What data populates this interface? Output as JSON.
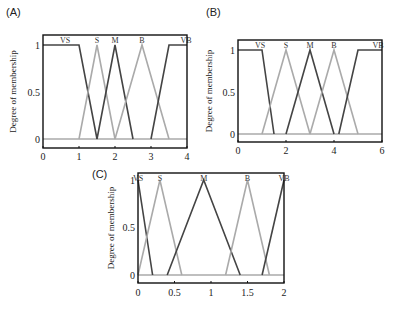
{
  "chart_data": [
    {
      "panel": "(A)",
      "type": "line",
      "ylabel": "Degree of membership",
      "xlabel": "",
      "xlim": [
        0,
        4
      ],
      "ylim": [
        0,
        1
      ],
      "xticks": [
        "0",
        "1",
        "2",
        "3",
        "4"
      ],
      "yticks": [
        "0",
        "0.5",
        "1"
      ],
      "series": [
        {
          "name": "VS",
          "color": "#444444",
          "points": [
            [
              0,
              1
            ],
            [
              1,
              1
            ],
            [
              1.5,
              0
            ]
          ]
        },
        {
          "name": "S",
          "color": "#aaaaaa",
          "points": [
            [
              1,
              0
            ],
            [
              1.5,
              1
            ],
            [
              2,
              0
            ]
          ]
        },
        {
          "name": "M",
          "color": "#444444",
          "points": [
            [
              1.5,
              0
            ],
            [
              2,
              1
            ],
            [
              2.5,
              0
            ]
          ]
        },
        {
          "name": "B",
          "color": "#aaaaaa",
          "points": [
            [
              2,
              0
            ],
            [
              2.75,
              1
            ],
            [
              3.5,
              0
            ]
          ]
        },
        {
          "name": "VB",
          "color": "#444444",
          "points": [
            [
              3,
              0
            ],
            [
              3.5,
              1
            ],
            [
              4,
              1
            ]
          ]
        }
      ]
    },
    {
      "panel": "(B)",
      "type": "line",
      "ylabel": "Degree of membership",
      "xlabel": "",
      "xlim": [
        0,
        6
      ],
      "ylim": [
        0,
        1
      ],
      "xticks": [
        "0",
        "2",
        "4",
        "6"
      ],
      "yticks": [
        "0",
        "0.5",
        "1"
      ],
      "series": [
        {
          "name": "VS",
          "color": "#444444",
          "points": [
            [
              0,
              1
            ],
            [
              1,
              1
            ],
            [
              1.5,
              0
            ]
          ]
        },
        {
          "name": "S",
          "color": "#aaaaaa",
          "points": [
            [
              1,
              0
            ],
            [
              2,
              1
            ],
            [
              3,
              0
            ]
          ]
        },
        {
          "name": "M",
          "color": "#444444",
          "points": [
            [
              2,
              0
            ],
            [
              3,
              1
            ],
            [
              4,
              0
            ]
          ]
        },
        {
          "name": "B",
          "color": "#aaaaaa",
          "points": [
            [
              3,
              0
            ],
            [
              4,
              1
            ],
            [
              5,
              0
            ]
          ]
        },
        {
          "name": "VB",
          "color": "#444444",
          "points": [
            [
              4.2,
              0
            ],
            [
              5,
              1
            ],
            [
              6,
              1
            ]
          ]
        }
      ]
    },
    {
      "panel": "(C)",
      "type": "line",
      "ylabel": "Degree of membership",
      "xlabel": "",
      "xlim": [
        0,
        2
      ],
      "ylim": [
        0,
        1
      ],
      "xticks": [
        "0",
        "0.5",
        "1",
        "1.5",
        "2"
      ],
      "yticks": [
        "0",
        "0.5",
        "1"
      ],
      "series": [
        {
          "name": "VS",
          "color": "#444444",
          "points": [
            [
              0,
              1
            ],
            [
              0.2,
              0
            ]
          ]
        },
        {
          "name": "S",
          "color": "#aaaaaa",
          "points": [
            [
              0,
              0
            ],
            [
              0.3,
              1
            ],
            [
              0.6,
              0
            ]
          ]
        },
        {
          "name": "M",
          "color": "#444444",
          "points": [
            [
              0.4,
              0
            ],
            [
              0.9,
              1
            ],
            [
              1.4,
              0
            ]
          ]
        },
        {
          "name": "B",
          "color": "#aaaaaa",
          "points": [
            [
              1.2,
              0
            ],
            [
              1.5,
              1
            ],
            [
              1.8,
              0
            ]
          ]
        },
        {
          "name": "VB",
          "color": "#444444",
          "points": [
            [
              1.7,
              0
            ],
            [
              2,
              1
            ]
          ]
        }
      ]
    }
  ],
  "panels": [
    {
      "label": "(A)"
    },
    {
      "label": "(B)"
    },
    {
      "label": "(C)"
    }
  ]
}
